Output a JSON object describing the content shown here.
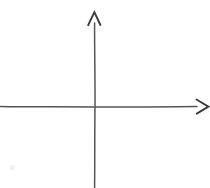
{
  "figure": {
    "background_color": "#ffffff",
    "ink_color": "#555555",
    "ink_color_dark": "#3a3a3a",
    "width": 210,
    "height": 188
  },
  "chart_data": {
    "type": "line",
    "title": "",
    "subtitle": "",
    "xlabel": "",
    "ylabel": "",
    "categories": [],
    "values": [],
    "series": [],
    "annotations": [],
    "legend": {
      "entries": [],
      "position": "none"
    },
    "grid": false,
    "axes": {
      "origin": {
        "x": 95,
        "y": 107
      },
      "x_axis": {
        "name": "x-axis",
        "orientation": "horizontal",
        "start": {
          "x": 0,
          "y": 107
        },
        "end": {
          "x": 196,
          "y": 107
        },
        "arrow_at": "end",
        "arrow_tip": {
          "x": 209,
          "y": 107
        },
        "tick_labels": [],
        "label": ""
      },
      "y_axis": {
        "name": "y-axis",
        "orientation": "vertical",
        "start": {
          "x": 95,
          "y": 188
        },
        "end": {
          "x": 95,
          "y": 24
        },
        "arrow_at": "end",
        "arrow_tip": {
          "x": 94,
          "y": 12
        },
        "tick_labels": [],
        "label": ""
      }
    },
    "xlim": [
      0,
      210
    ],
    "ylim": [
      0,
      188
    ]
  },
  "marks": {
    "smudge": {
      "name": "faint-pencil-smudge",
      "x": 10,
      "y": 165,
      "width": 5,
      "height": 5,
      "color": "#f2f2f2"
    }
  }
}
